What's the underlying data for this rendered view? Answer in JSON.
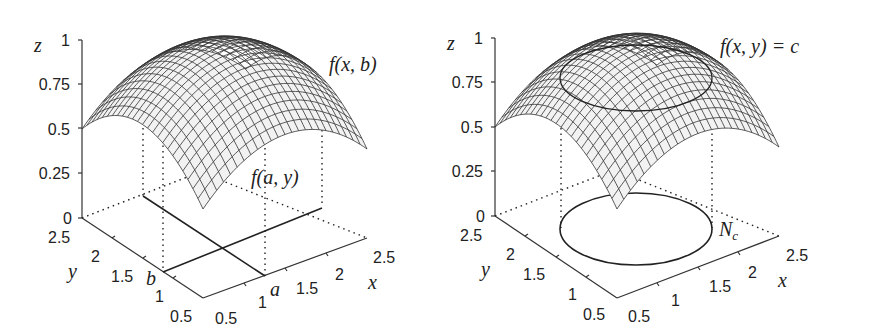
{
  "chart_data": [
    {
      "type": "surface",
      "title": "",
      "function_shape": "concave paraboloid (dome), max z=1 at center, z=0.5 at corners",
      "xlabel": "x",
      "ylabel": "y",
      "zlabel": "z",
      "x_ticks": [
        "0.5",
        "1",
        "1.5",
        "2",
        "2.5"
      ],
      "y_ticks": [
        "0.5",
        "1",
        "1.5",
        "2",
        "2.5"
      ],
      "z_ticks": [
        "0",
        "0.25",
        "0.5",
        "0.75",
        "1"
      ],
      "xlim": [
        0.5,
        2.5
      ],
      "ylim": [
        0.5,
        2.5
      ],
      "zlim": [
        0,
        1
      ],
      "annotations": {
        "curve_x": "f(x,b)",
        "curve_y": "f(a,y)",
        "x_marker": "a",
        "y_marker": "b"
      }
    },
    {
      "type": "surface",
      "title": "",
      "function_shape": "concave paraboloid (dome), level curve drawn on surface and projected to z=0",
      "xlabel": "x",
      "ylabel": "y",
      "zlabel": "z",
      "x_ticks": [
        "0.5",
        "1",
        "1.5",
        "2",
        "2.5"
      ],
      "y_ticks": [
        "0.5",
        "1",
        "1.5",
        "2",
        "2.5"
      ],
      "z_ticks": [
        "0",
        "0.25",
        "0.5",
        "0.75",
        "1"
      ],
      "xlim": [
        0.5,
        2.5
      ],
      "ylim": [
        0.5,
        2.5
      ],
      "zlim": [
        0,
        1
      ],
      "annotations": {
        "level_curve": "f(x,y) = c",
        "level_set": "N",
        "level_set_subscript": "c"
      }
    }
  ],
  "left": {
    "z_label": "z",
    "y_label": "y",
    "x_label": "x",
    "z_ticks": [
      "1",
      "0.75",
      "0.5",
      "0.25",
      "0"
    ],
    "y_ticks": [
      "2.5",
      "2",
      "1.5",
      "1",
      "0.5"
    ],
    "x_ticks": [
      "0.5",
      "1",
      "1.5",
      "2",
      "2.5"
    ],
    "label_fxb": "f(x, b)",
    "label_fay": "f(a, y)",
    "marker_a": "a",
    "marker_b": "b"
  },
  "right": {
    "z_label": "z",
    "y_label": "y",
    "x_label": "x",
    "z_ticks": [
      "1",
      "0.75",
      "0.5",
      "0.25",
      "0"
    ],
    "y_ticks": [
      "2.5",
      "2",
      "1.5",
      "1",
      "0.5"
    ],
    "x_ticks": [
      "0.5",
      "1",
      "1.5",
      "2",
      "2.5"
    ],
    "label_level": "f(x, y) = c",
    "label_N": "N",
    "label_N_sub": "c"
  }
}
